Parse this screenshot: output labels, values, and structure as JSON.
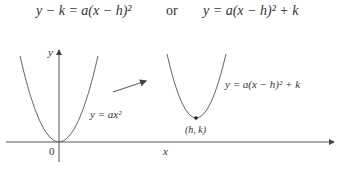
{
  "equations": {
    "left": "y − k = a(x − h)²",
    "connector": "or",
    "right": "y = a(x − h)² + k"
  },
  "diagram": {
    "axis_labels": {
      "x": "x",
      "y": "y",
      "origin": "0"
    },
    "curves": [
      {
        "name": "standard-parabola",
        "label": "y = ax²",
        "vertex": "0"
      },
      {
        "name": "shifted-parabola",
        "label": "y = a(x − h)² + k",
        "vertex": "(h, k)"
      }
    ],
    "transform_arrow": "shift"
  },
  "colors": {
    "stroke": "#555555",
    "text": "#333333"
  }
}
